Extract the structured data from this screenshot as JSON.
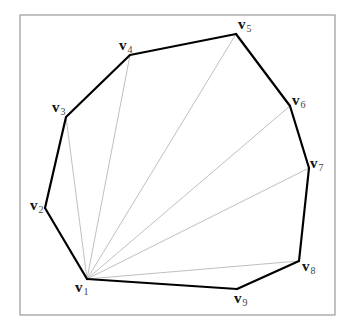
{
  "diagram": {
    "title": "",
    "colors": {
      "frame": "#9a9a9a",
      "edge": "#000000",
      "diagonal": "#b8b8b8",
      "label": "#111111"
    },
    "vertices": [
      {
        "id": "v1",
        "main": "v",
        "sub": "1"
      },
      {
        "id": "v2",
        "main": "v",
        "sub": "2"
      },
      {
        "id": "v3",
        "main": "v",
        "sub": "3"
      },
      {
        "id": "v4",
        "main": "v",
        "sub": "4"
      },
      {
        "id": "v5",
        "main": "v",
        "sub": "5"
      },
      {
        "id": "v6",
        "main": "v",
        "sub": "6"
      },
      {
        "id": "v7",
        "main": "v",
        "sub": "7"
      },
      {
        "id": "v8",
        "main": "v",
        "sub": "8"
      },
      {
        "id": "v9",
        "main": "v",
        "sub": "9"
      }
    ],
    "polygon_order": [
      "v1",
      "v2",
      "v3",
      "v4",
      "v5",
      "v6",
      "v7",
      "v8",
      "v9"
    ],
    "diagonals": [
      [
        "v1",
        "v3"
      ],
      [
        "v1",
        "v4"
      ],
      [
        "v1",
        "v5"
      ],
      [
        "v1",
        "v6"
      ],
      [
        "v1",
        "v7"
      ],
      [
        "v1",
        "v8"
      ]
    ]
  }
}
